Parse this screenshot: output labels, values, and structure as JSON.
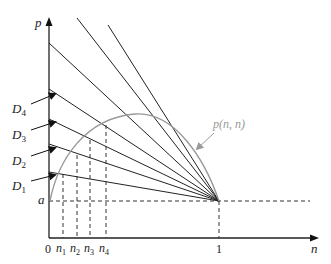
{
  "figure": {
    "axes": {
      "y_label": "p",
      "x_label": "n",
      "origin_label": "0",
      "x_tick_one": "1",
      "y_tick_a": "a"
    },
    "curve": {
      "label": "p(n, n)",
      "color": "#999999"
    },
    "lines": [
      {
        "name": "D1",
        "label": "D",
        "sub": "1"
      },
      {
        "name": "D2",
        "label": "D",
        "sub": "2"
      },
      {
        "name": "D3",
        "label": "D",
        "sub": "3"
      },
      {
        "name": "D4",
        "label": "D",
        "sub": "4"
      }
    ],
    "n_ticks": [
      {
        "label": "n",
        "sub": "1"
      },
      {
        "label": "n",
        "sub": "2"
      },
      {
        "label": "n",
        "sub": "3"
      },
      {
        "label": "n",
        "sub": "4"
      }
    ],
    "colors": {
      "lines": "#222222",
      "curve": "#999999",
      "dashed": "#333333"
    }
  }
}
